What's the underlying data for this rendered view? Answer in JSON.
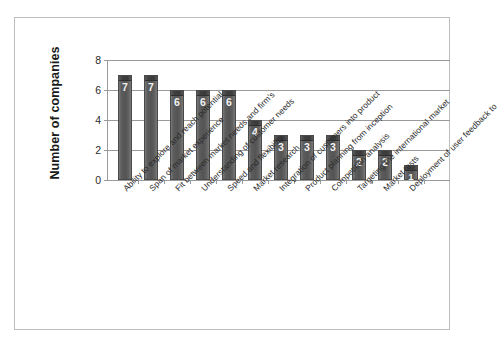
{
  "chart_data": {
    "type": "bar",
    "title": "",
    "xlabel": "",
    "ylabel": "Number of companies",
    "ylim": [
      0,
      8
    ],
    "yticks": [
      "0",
      "2",
      "4",
      "6",
      "8"
    ],
    "grid": true,
    "legend": "none",
    "orientation": "vertical",
    "categories": [
      "Ability to explore and reach potential",
      "Span of market experience",
      "Fit between market needs and firm's",
      "Understanding of customer needs",
      "Speed and flexibility",
      "Market research",
      "Integration of customers into product",
      "Product planning from inception",
      "Competition analysis",
      "Targeting the international market",
      "Market tests",
      "Deployment of user feedback to"
    ],
    "values": [
      7,
      7,
      6,
      6,
      6,
      4,
      3,
      3,
      3,
      2,
      2,
      1
    ],
    "value_labels": [
      "7",
      "7",
      "6",
      "6",
      "6",
      "4",
      "3",
      "3",
      "3",
      "2",
      "2",
      "1"
    ],
    "colors": {
      "bar_fill": "#545454",
      "bar_cap": "#3a3a3a",
      "bar_outline": "#4a4a4a",
      "value_text": "#f2f2f2",
      "gridline": "#9a9a9a",
      "axis_text": "#2b2b2b",
      "frame": "#bdbdbd",
      "background": "#ffffff"
    }
  }
}
